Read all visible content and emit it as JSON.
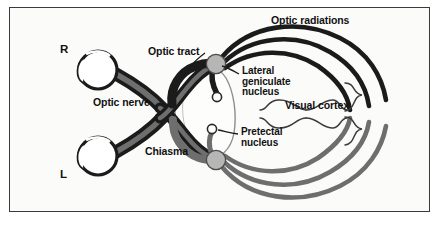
{
  "figure": {
    "kind": "anatomical-diagram",
    "background_color": "#fbfbfa",
    "frame_color": "#3a3a3a"
  },
  "labels": {
    "right_side": "R",
    "left_side": "L",
    "optic_nerve": "Optic nerve",
    "optic_tract": "Optic tract",
    "chiasma": "Chiasma",
    "optic_radiations": "Optic radiations",
    "lateral_geniculate_nucleus_line1": "Lateral",
    "lateral_geniculate_nucleus_line2": "geniculate",
    "lateral_geniculate_nucleus_line3": "nucleus",
    "pretectal_nucleus_line1": "Pretectal",
    "pretectal_nucleus_line2": "nucleus",
    "visual_cortex": "Visual cortex"
  },
  "colors": {
    "nerve_dark": "#1b1b1b",
    "nerve_gray": "#6e6e6e",
    "nucleus_fill": "#b6b6b6",
    "nucleus_stroke": "#4a4a4a",
    "eye_fill": "#ffffff",
    "eye_stroke": "#1b1b1b",
    "brainstem_stroke": "#8a8a8a",
    "leader_line": "#1b1b1b",
    "bracket": "#3c3c3c"
  },
  "structures": {
    "eyes": [
      {
        "name": "right-eye",
        "cx": 98,
        "cy": 70,
        "r": 19
      },
      {
        "name": "left-eye",
        "cx": 98,
        "cy": 156,
        "r": 19
      }
    ],
    "nuclei": [
      {
        "name": "lateral-geniculate-nucleus",
        "cx": 216,
        "cy": 64,
        "r": 9.5
      },
      {
        "name": "pretectal-nucleus",
        "cx": 216,
        "cy": 160,
        "r": 9.5
      },
      {
        "name": "lgn-terminal-small",
        "cx": 217,
        "cy": 97,
        "r": 4.5
      },
      {
        "name": "pretectal-terminal-small",
        "cx": 212,
        "cy": 129,
        "r": 4.5
      }
    ],
    "optic_radiation_count": 3,
    "visual_cortex_brackets": 2
  }
}
